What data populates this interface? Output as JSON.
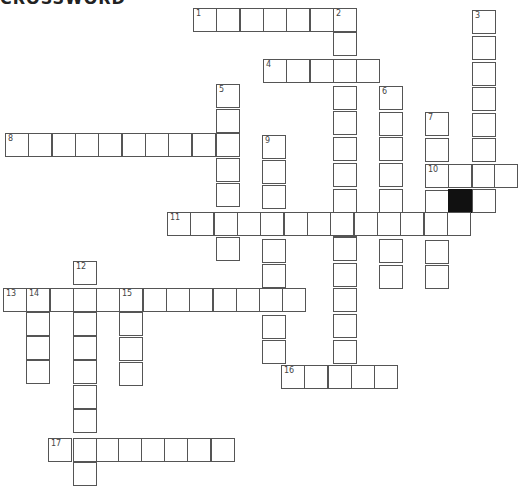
{
  "title": "CROSSWORD",
  "cell_size": 23.4,
  "grid": {
    "cells": [
      {
        "x": 193,
        "y": 8,
        "n": "1"
      },
      {
        "x": 216,
        "y": 8
      },
      {
        "x": 240,
        "y": 8
      },
      {
        "x": 263,
        "y": 8
      },
      {
        "x": 286,
        "y": 8
      },
      {
        "x": 310,
        "y": 8
      },
      {
        "x": 333,
        "y": 8,
        "n": "2"
      },
      {
        "x": 333,
        "y": 32
      },
      {
        "x": 333,
        "y": 59
      },
      {
        "x": 333,
        "y": 86
      },
      {
        "x": 333,
        "y": 111
      },
      {
        "x": 333,
        "y": 137
      },
      {
        "x": 333,
        "y": 163
      },
      {
        "x": 333,
        "y": 189
      },
      {
        "x": 333,
        "y": 213
      },
      {
        "x": 333,
        "y": 237
      },
      {
        "x": 333,
        "y": 263
      },
      {
        "x": 333,
        "y": 288
      },
      {
        "x": 333,
        "y": 314
      },
      {
        "x": 333,
        "y": 340
      },
      {
        "x": 472,
        "y": 10,
        "n": "3"
      },
      {
        "x": 472,
        "y": 36
      },
      {
        "x": 472,
        "y": 62
      },
      {
        "x": 472,
        "y": 87
      },
      {
        "x": 472,
        "y": 113
      },
      {
        "x": 472,
        "y": 138
      },
      {
        "x": 472,
        "y": 164
      },
      {
        "x": 472,
        "y": 189
      },
      {
        "x": 263,
        "y": 59,
        "n": "4"
      },
      {
        "x": 286,
        "y": 59
      },
      {
        "x": 310,
        "y": 59
      },
      {
        "x": 356,
        "y": 59
      },
      {
        "x": 216,
        "y": 84,
        "n": "5"
      },
      {
        "x": 216,
        "y": 109
      },
      {
        "x": 216,
        "y": 158
      },
      {
        "x": 216,
        "y": 183
      },
      {
        "x": 216,
        "y": 237
      },
      {
        "x": 379,
        "y": 86,
        "n": "6"
      },
      {
        "x": 379,
        "y": 112
      },
      {
        "x": 379,
        "y": 137
      },
      {
        "x": 379,
        "y": 163
      },
      {
        "x": 379,
        "y": 189
      },
      {
        "x": 379,
        "y": 239
      },
      {
        "x": 379,
        "y": 265
      },
      {
        "x": 425,
        "y": 112,
        "n": "7"
      },
      {
        "x": 425,
        "y": 138
      },
      {
        "x": 425,
        "y": 164,
        "n": "10"
      },
      {
        "x": 425,
        "y": 190
      },
      {
        "x": 425,
        "y": 240
      },
      {
        "x": 425,
        "y": 265
      },
      {
        "x": 5,
        "y": 133,
        "n": "8"
      },
      {
        "x": 28,
        "y": 133
      },
      {
        "x": 52,
        "y": 133
      },
      {
        "x": 75,
        "y": 133
      },
      {
        "x": 98,
        "y": 133
      },
      {
        "x": 122,
        "y": 133
      },
      {
        "x": 145,
        "y": 133
      },
      {
        "x": 168,
        "y": 133
      },
      {
        "x": 192,
        "y": 133
      },
      {
        "x": 216,
        "y": 133
      },
      {
        "x": 262,
        "y": 135,
        "n": "9"
      },
      {
        "x": 262,
        "y": 160
      },
      {
        "x": 262,
        "y": 185
      },
      {
        "x": 262,
        "y": 239
      },
      {
        "x": 262,
        "y": 264
      },
      {
        "x": 262,
        "y": 315
      },
      {
        "x": 262,
        "y": 340
      },
      {
        "x": 448,
        "y": 164
      },
      {
        "x": 494,
        "y": 164
      },
      {
        "x": 448,
        "y": 189,
        "black": true
      },
      {
        "x": 167,
        "y": 212,
        "n": "11"
      },
      {
        "x": 190,
        "y": 212
      },
      {
        "x": 214,
        "y": 212
      },
      {
        "x": 237,
        "y": 212
      },
      {
        "x": 260,
        "y": 212
      },
      {
        "x": 284,
        "y": 212
      },
      {
        "x": 307,
        "y": 212
      },
      {
        "x": 330,
        "y": 212
      },
      {
        "x": 354,
        "y": 212
      },
      {
        "x": 377,
        "y": 212
      },
      {
        "x": 400,
        "y": 212
      },
      {
        "x": 424,
        "y": 212
      },
      {
        "x": 447,
        "y": 212
      },
      {
        "x": 73,
        "y": 261,
        "n": "12"
      },
      {
        "x": 73,
        "y": 312
      },
      {
        "x": 73,
        "y": 336
      },
      {
        "x": 73,
        "y": 360
      },
      {
        "x": 73,
        "y": 385
      },
      {
        "x": 73,
        "y": 409
      },
      {
        "x": 73,
        "y": 438
      },
      {
        "x": 73,
        "y": 462
      },
      {
        "x": 3,
        "y": 288,
        "n": "13"
      },
      {
        "x": 26,
        "y": 288,
        "n": "14"
      },
      {
        "x": 50,
        "y": 288
      },
      {
        "x": 73,
        "y": 288
      },
      {
        "x": 96,
        "y": 288
      },
      {
        "x": 119,
        "y": 288,
        "n": "15"
      },
      {
        "x": 143,
        "y": 288
      },
      {
        "x": 166,
        "y": 288
      },
      {
        "x": 189,
        "y": 288
      },
      {
        "x": 213,
        "y": 288
      },
      {
        "x": 236,
        "y": 288
      },
      {
        "x": 259,
        "y": 288
      },
      {
        "x": 282,
        "y": 288
      },
      {
        "x": 26,
        "y": 312
      },
      {
        "x": 26,
        "y": 336
      },
      {
        "x": 26,
        "y": 360
      },
      {
        "x": 119,
        "y": 312
      },
      {
        "x": 119,
        "y": 337
      },
      {
        "x": 119,
        "y": 362
      },
      {
        "x": 281,
        "y": 365,
        "n": "16"
      },
      {
        "x": 304,
        "y": 365
      },
      {
        "x": 328,
        "y": 365
      },
      {
        "x": 351,
        "y": 365
      },
      {
        "x": 374,
        "y": 365
      },
      {
        "x": 48,
        "y": 438,
        "n": "17"
      },
      {
        "x": 96,
        "y": 438
      },
      {
        "x": 118,
        "y": 438
      },
      {
        "x": 141,
        "y": 438
      },
      {
        "x": 164,
        "y": 438
      },
      {
        "x": 187,
        "y": 438
      },
      {
        "x": 211,
        "y": 438
      }
    ]
  }
}
